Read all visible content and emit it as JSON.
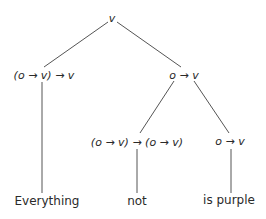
{
  "diagram": {
    "type": "tree",
    "nodes": {
      "root": {
        "label": "v"
      },
      "left": {
        "label": "(o → v) → v"
      },
      "right": {
        "label": "o → v"
      },
      "right_left": {
        "label": "(o → v) → (o → v)"
      },
      "right_right": {
        "label": "o → v"
      }
    },
    "leaves": {
      "everything": {
        "label": "Everything"
      },
      "not": {
        "label": "not"
      },
      "is_purple": {
        "label": "is purple"
      }
    },
    "line_color": "#555555"
  }
}
